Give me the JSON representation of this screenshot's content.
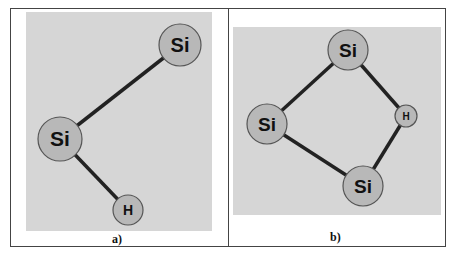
{
  "figure": {
    "panels": [
      {
        "caption": "a)",
        "atoms": [
          {
            "label": "Si",
            "x": 180,
            "y": 45,
            "r": 21
          },
          {
            "label": "Si",
            "x": 60,
            "y": 139,
            "r": 22
          },
          {
            "label": "H",
            "x": 128,
            "y": 210,
            "r": 15
          }
        ],
        "bonds": [
          [
            0,
            1
          ],
          [
            1,
            2
          ]
        ]
      },
      {
        "caption": "b)",
        "atoms": [
          {
            "label": "Si",
            "x": 348,
            "y": 50,
            "r": 20
          },
          {
            "label": "Si",
            "x": 267,
            "y": 124,
            "r": 20
          },
          {
            "label": "H",
            "x": 406,
            "y": 116,
            "r": 11
          },
          {
            "label": "Si",
            "x": 363,
            "y": 186,
            "r": 20
          }
        ],
        "bonds": [
          [
            0,
            1
          ],
          [
            0,
            2
          ],
          [
            1,
            3
          ],
          [
            2,
            3
          ]
        ]
      }
    ],
    "colors": {
      "atom_fill": "#b8b8b8",
      "atom_stroke": "#555555",
      "bond": "#222222",
      "background": "#d6d6d6"
    }
  }
}
